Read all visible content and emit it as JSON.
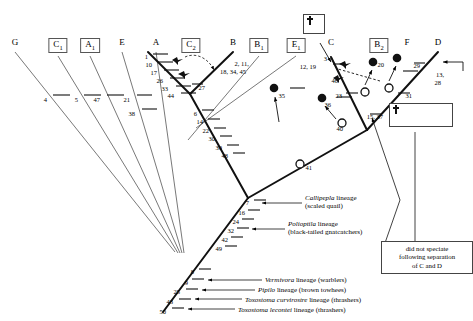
{
  "diagram": {
    "type": "phylogenetic-tree-cladogram",
    "taxa": [
      {
        "label": "G",
        "sub": "",
        "x": 15,
        "boxed": false
      },
      {
        "label": "C",
        "sub": "1",
        "x": 58,
        "boxed": true
      },
      {
        "label": "A",
        "sub": "1",
        "x": 90,
        "boxed": true
      },
      {
        "label": "E",
        "sub": "",
        "x": 122,
        "boxed": false
      },
      {
        "label": "A",
        "sub": "",
        "x": 156,
        "boxed": false
      },
      {
        "label": "C",
        "sub": "2",
        "x": 191,
        "boxed": true
      },
      {
        "label": "B",
        "sub": "",
        "x": 233,
        "boxed": false
      },
      {
        "label": "B",
        "sub": "1",
        "x": 259,
        "boxed": true
      },
      {
        "label": "E",
        "sub": "1",
        "x": 296,
        "boxed": true
      },
      {
        "label": "C",
        "sub": "",
        "x": 331,
        "boxed": false
      },
      {
        "label": "B",
        "sub": "2",
        "x": 379,
        "boxed": true
      },
      {
        "label": "F",
        "sub": "",
        "x": 407,
        "boxed": false
      },
      {
        "label": "D",
        "sub": "",
        "x": 438,
        "boxed": false
      }
    ],
    "characters": [
      {
        "id": "c1",
        "text": "1",
        "x": 148,
        "y": 53
      },
      {
        "id": "c10",
        "text": "10",
        "x": 152,
        "y": 61
      },
      {
        "id": "c17",
        "text": "17",
        "x": 157,
        "y": 69
      },
      {
        "id": "c26",
        "text": "26",
        "x": 163,
        "y": 77
      },
      {
        "id": "c33",
        "text": "33",
        "x": 168,
        "y": 85
      },
      {
        "id": "c44",
        "text": "44",
        "x": 174,
        "y": 92
      },
      {
        "id": "c27",
        "text": "27",
        "x": 205,
        "y": 84
      },
      {
        "id": "c2",
        "text": "2, 11,",
        "x": 249,
        "y": 60
      },
      {
        "id": "c18",
        "text": "18, 34, 45",
        "x": 246,
        "y": 68
      },
      {
        "id": "c6",
        "text": "6",
        "x": 197,
        "y": 110
      },
      {
        "id": "c14",
        "text": "14",
        "x": 203,
        "y": 118
      },
      {
        "id": "c22",
        "text": "22",
        "x": 209,
        "y": 127
      },
      {
        "id": "c30",
        "text": "30",
        "x": 215,
        "y": 135
      },
      {
        "id": "c39",
        "text": "39",
        "x": 222,
        "y": 144
      },
      {
        "id": "c48",
        "text": "48",
        "x": 228,
        "y": 152
      },
      {
        "id": "c3",
        "text": "3",
        "x": 327,
        "y": 55
      },
      {
        "id": "c12",
        "text": "12, 19",
        "x": 316,
        "y": 63
      },
      {
        "id": "c46",
        "text": "46",
        "x": 338,
        "y": 77
      },
      {
        "id": "c23",
        "text": "23",
        "x": 342,
        "y": 92
      },
      {
        "id": "c20",
        "text": "20",
        "x": 384,
        "y": 61
      },
      {
        "id": "c29",
        "text": "29",
        "x": 420,
        "y": 62
      },
      {
        "id": "c13",
        "text": "13,",
        "x": 444,
        "y": 71
      },
      {
        "id": "c28",
        "text": "28",
        "x": 441,
        "y": 79
      },
      {
        "id": "c31",
        "text": "31",
        "x": 412,
        "y": 92
      },
      {
        "id": "c1537",
        "text": "15, 37",
        "x": 383,
        "y": 113
      },
      {
        "id": "c40",
        "text": "40",
        "x": 343,
        "y": 125
      },
      {
        "id": "c41",
        "text": "41",
        "x": 312,
        "y": 164
      },
      {
        "id": "c4",
        "text": "4",
        "x": 47,
        "y": 96
      },
      {
        "id": "c5",
        "text": "5",
        "x": 78,
        "y": 96
      },
      {
        "id": "c47",
        "text": "47",
        "x": 100,
        "y": 96
      },
      {
        "id": "c21",
        "text": "21",
        "x": 130,
        "y": 96
      },
      {
        "id": "c38",
        "text": "38",
        "x": 135,
        "y": 110
      },
      {
        "id": "c35",
        "text": "35",
        "x": 285,
        "y": 92
      },
      {
        "id": "c36",
        "text": "36",
        "x": 331,
        "y": 101
      },
      {
        "id": "c7",
        "text": "7",
        "x": 249,
        "y": 199
      },
      {
        "id": "c16",
        "text": "16",
        "x": 245,
        "y": 209
      },
      {
        "id": "c24",
        "text": "24",
        "x": 239,
        "y": 218
      },
      {
        "id": "c32",
        "text": "32",
        "x": 234,
        "y": 227
      },
      {
        "id": "c42",
        "text": "42",
        "x": 228,
        "y": 236
      },
      {
        "id": "c49",
        "text": "49",
        "x": 222,
        "y": 245
      },
      {
        "id": "c8",
        "text": "8",
        "x": 194,
        "y": 268
      },
      {
        "id": "c9",
        "text": "9",
        "x": 188,
        "y": 279
      },
      {
        "id": "c25",
        "text": "25",
        "x": 180,
        "y": 288
      },
      {
        "id": "c43",
        "text": "43",
        "x": 173,
        "y": 298
      },
      {
        "id": "c50",
        "text": "50",
        "x": 166,
        "y": 308
      }
    ],
    "lineage_labels": [
      {
        "id": "callipepla",
        "line1": "Callipepla lineage",
        "line2": "(scaled quail)",
        "italic1": "Callipepla",
        "rest1": " lineage",
        "x": 305,
        "y": 196
      },
      {
        "id": "polioptila",
        "line1": "Polioptila lineage",
        "line2": "(black-tailed gnatcatchers)",
        "italic1": "Polioptila",
        "rest1": " lineage",
        "x": 288,
        "y": 222
      },
      {
        "id": "vermivora",
        "line1": "Vermivora lineage (warblers)",
        "line2": "",
        "italic1": "Vermivora",
        "rest1": " lineage (warblers)",
        "x": 265,
        "y": 276
      },
      {
        "id": "pipilo",
        "line1": "Pipilo lineage (brown towhees)",
        "line2": "",
        "italic1": "Pipilo",
        "rest1": " lineage (brown towhees)",
        "x": 258,
        "y": 286
      },
      {
        "id": "toxostoma-curvirostre",
        "line1": "Toxostoma curvirostre lineage (thrashers)",
        "line2": "",
        "italic1": "Toxostoma curvirostre",
        "rest1": " lineage (thrashers)",
        "x": 245,
        "y": 296
      },
      {
        "id": "toxostoma-lecontei",
        "line1": "Toxostoma lecontei lineage (thrashers)",
        "line2": "",
        "italic1": "Toxostoma lecontei",
        "rest1": " lineage (thrashers)",
        "x": 238,
        "y": 306
      }
    ],
    "note_box": {
      "line1": "did not speciate",
      "line2": "following separation",
      "line3": "of C and D"
    },
    "symbols": {
      "single_cross_label": "cross-symbol",
      "triple_cross_label": "triple-cross-symbol",
      "filled_circle_label": "filled-circle-marker",
      "open_circle_label": "open-circle-marker",
      "bird_label": "bird-silhouette"
    }
  }
}
